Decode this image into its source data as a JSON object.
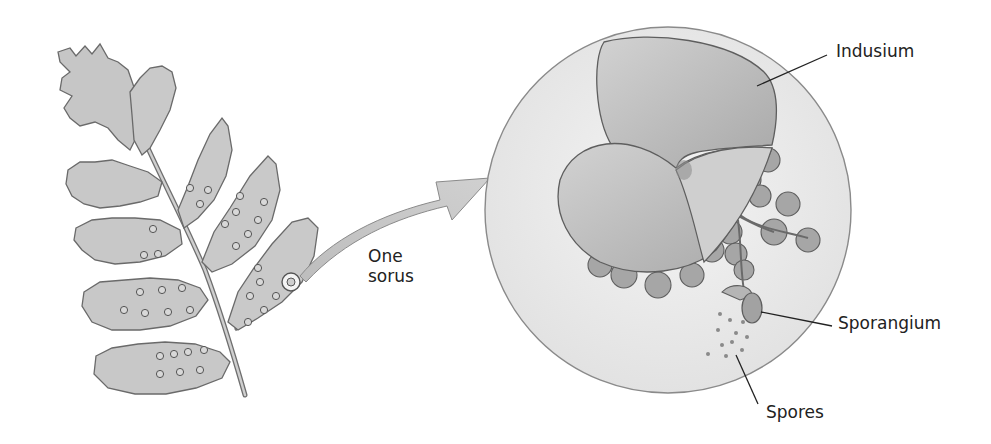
{
  "figure": {
    "colors": {
      "leaf_fill": "#c9c9c9",
      "leaf_stroke": "#6a6a6a",
      "arrow_fill": "#c2c2c2",
      "circle_fill": "#ececec",
      "indusium_fill": "#bdbdbd",
      "sporangium_fill": "#a9a9a9",
      "label_color": "#222222"
    }
  },
  "labels": {
    "one_sorus_line1": "One",
    "one_sorus_line2": "sorus",
    "indusium": "Indusium",
    "sporangium": "Sporangium",
    "spores": "Spores"
  }
}
